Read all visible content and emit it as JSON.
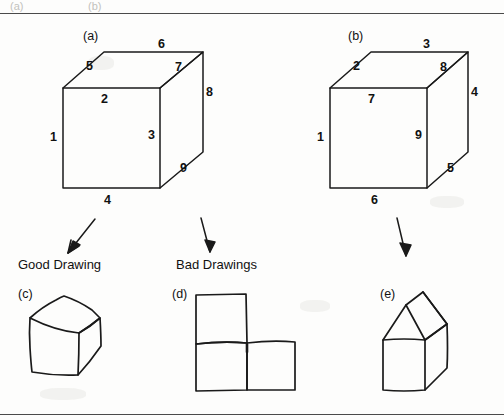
{
  "figure": {
    "background_color": "#fdfdfc",
    "ink_color": "#1a1a1a",
    "rule_color": "#4a4a4a",
    "cropped_header_fragment_left": "(a)",
    "cropped_header_fragment_right": "(b)"
  },
  "panels": {
    "a": {
      "letter": "(a)",
      "type": "reference-cube",
      "edge_labels": [
        "1",
        "2",
        "3",
        "4",
        "5",
        "6",
        "7",
        "8",
        "9"
      ],
      "edges": [
        {
          "id": "1",
          "position": "front-left-vertical"
        },
        {
          "id": "2",
          "position": "front-top-horizontal"
        },
        {
          "id": "3",
          "position": "front-right-vertical"
        },
        {
          "id": "4",
          "position": "front-bottom-horizontal"
        },
        {
          "id": "5",
          "position": "top-left-receding"
        },
        {
          "id": "6",
          "position": "top-back-horizontal"
        },
        {
          "id": "7",
          "position": "top-right-receding"
        },
        {
          "id": "8",
          "position": "back-right-vertical"
        },
        {
          "id": "9",
          "position": "bottom-right-receding"
        }
      ]
    },
    "b": {
      "letter": "(b)",
      "type": "reference-cube",
      "edge_labels": [
        "1",
        "2",
        "3",
        "4",
        "5",
        "6",
        "7",
        "8",
        "9"
      ],
      "edges": [
        {
          "id": "1",
          "position": "front-left-vertical"
        },
        {
          "id": "2",
          "position": "top-left-receding"
        },
        {
          "id": "3",
          "position": "top-back-horizontal"
        },
        {
          "id": "4",
          "position": "back-right-vertical"
        },
        {
          "id": "5",
          "position": "bottom-right-receding"
        },
        {
          "id": "6",
          "position": "front-bottom-horizontal"
        },
        {
          "id": "7",
          "position": "front-top-horizontal"
        },
        {
          "id": "8",
          "position": "top-right-receding"
        },
        {
          "id": "9",
          "position": "front-right-vertical"
        }
      ]
    },
    "c": {
      "letter": "(c)",
      "type": "hand-drawn-cube",
      "category": "good"
    },
    "d": {
      "letter": "(d)",
      "type": "three-squares-staircase",
      "category": "bad"
    },
    "e": {
      "letter": "(e)",
      "type": "house-shape-with-roof",
      "category": "bad"
    }
  },
  "captions": {
    "good": "Good Drawing",
    "bad": "Bad Drawings"
  },
  "arrows": [
    {
      "name": "arrow-to-good-drawing",
      "from_panel": "a",
      "to": "good"
    },
    {
      "name": "arrow-to-bad-drawing-d",
      "from_panel": "a",
      "to": "bad"
    },
    {
      "name": "arrow-to-bad-drawing-e",
      "from_panel": "b",
      "to": "bad"
    }
  ]
}
